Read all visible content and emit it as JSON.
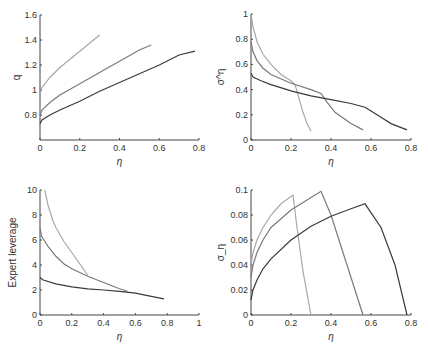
{
  "colors": {
    "light": "#a8a8a8",
    "medium": "#7a7a7a",
    "dark": "#3a3a3a",
    "axis": "#444444"
  },
  "chart_data": [
    {
      "type": "line",
      "id": "q",
      "xlabel": "η",
      "ylabel": "q",
      "xlim": [
        0,
        0.8
      ],
      "ylim": [
        0.6,
        1.6
      ],
      "xticks": [
        0,
        0.2,
        0.4,
        0.6,
        0.8
      ],
      "xtick_labels": [
        "0",
        "0.2",
        "0.4",
        "0.6",
        "0.8"
      ],
      "yticks": [
        0.8,
        1,
        1.2,
        1.4,
        1.6
      ],
      "ytick_labels": [
        "0.8",
        "1",
        "1.2",
        "1.4",
        "1.6"
      ],
      "series": [
        {
          "name": "light",
          "x": [
            0,
            0.01,
            0.05,
            0.1,
            0.2,
            0.3
          ],
          "y": [
            0.97,
            1.02,
            1.1,
            1.18,
            1.31,
            1.44
          ]
        },
        {
          "name": "medium",
          "x": [
            0,
            0.01,
            0.05,
            0.1,
            0.2,
            0.3,
            0.4,
            0.5,
            0.56
          ],
          "y": [
            0.8,
            0.84,
            0.9,
            0.96,
            1.05,
            1.14,
            1.23,
            1.32,
            1.36
          ]
        },
        {
          "name": "dark",
          "x": [
            0,
            0.01,
            0.05,
            0.1,
            0.2,
            0.3,
            0.4,
            0.5,
            0.6,
            0.7,
            0.78
          ],
          "y": [
            0.73,
            0.76,
            0.8,
            0.84,
            0.91,
            0.99,
            1.06,
            1.13,
            1.2,
            1.28,
            1.31
          ]
        }
      ]
    },
    {
      "type": "line",
      "id": "sigma-eta",
      "xlabel": "η",
      "ylabel": "σ^η",
      "xlim": [
        0,
        0.8
      ],
      "ylim": [
        0,
        1
      ],
      "xticks": [
        0,
        0.2,
        0.4,
        0.6,
        0.8
      ],
      "xtick_labels": [
        "0",
        "0.2",
        "0.4",
        "0.6",
        "0.8"
      ],
      "yticks": [
        0,
        0.2,
        0.4,
        0.6,
        0.8,
        1
      ],
      "ytick_labels": [
        "0",
        "0.2",
        "0.4",
        "0.6",
        "0.8",
        "1"
      ],
      "series": [
        {
          "name": "light",
          "x": [
            0,
            0.01,
            0.03,
            0.06,
            0.1,
            0.15,
            0.2,
            0.22,
            0.24,
            0.26,
            0.28,
            0.3
          ],
          "y": [
            1.0,
            0.9,
            0.78,
            0.68,
            0.6,
            0.52,
            0.47,
            0.44,
            0.33,
            0.22,
            0.13,
            0.07
          ]
        },
        {
          "name": "medium",
          "x": [
            0,
            0.01,
            0.03,
            0.06,
            0.1,
            0.2,
            0.3,
            0.35,
            0.38,
            0.42,
            0.5,
            0.56
          ],
          "y": [
            0.78,
            0.7,
            0.63,
            0.57,
            0.52,
            0.45,
            0.4,
            0.37,
            0.3,
            0.22,
            0.13,
            0.08
          ]
        },
        {
          "name": "dark",
          "x": [
            0,
            0.01,
            0.05,
            0.1,
            0.2,
            0.3,
            0.4,
            0.5,
            0.57,
            0.6,
            0.65,
            0.7,
            0.78
          ],
          "y": [
            0.53,
            0.5,
            0.47,
            0.44,
            0.39,
            0.35,
            0.32,
            0.29,
            0.26,
            0.23,
            0.18,
            0.13,
            0.08
          ]
        }
      ]
    },
    {
      "type": "line",
      "id": "expert-leverage",
      "xlabel": "η",
      "ylabel": "Expert leverage",
      "xlim": [
        0,
        1
      ],
      "ylim": [
        0,
        10
      ],
      "xticks": [
        0,
        0.2,
        0.4,
        0.6,
        0.8,
        1
      ],
      "xtick_labels": [
        "0",
        "0.2",
        "0.4",
        "0.6",
        "0.8",
        "1"
      ],
      "yticks": [
        0,
        2,
        4,
        6,
        8,
        10
      ],
      "ytick_labels": [
        "0",
        "2",
        "4",
        "6",
        "8",
        "10"
      ],
      "series": [
        {
          "name": "light",
          "x": [
            0.03,
            0.05,
            0.08,
            0.1,
            0.15,
            0.2,
            0.25,
            0.3
          ],
          "y": [
            10,
            8.8,
            7.6,
            7.0,
            5.9,
            5.0,
            4.1,
            3.2
          ]
        },
        {
          "name": "medium",
          "x": [
            0,
            0.01,
            0.03,
            0.05,
            0.1,
            0.15,
            0.2,
            0.3,
            0.4,
            0.5,
            0.55
          ],
          "y": [
            7.0,
            6.3,
            5.9,
            5.5,
            4.7,
            4.1,
            3.7,
            3.1,
            2.6,
            2.1,
            1.9
          ]
        },
        {
          "name": "dark",
          "x": [
            0,
            0.02,
            0.1,
            0.2,
            0.3,
            0.4,
            0.5,
            0.6,
            0.7,
            0.78
          ],
          "y": [
            3.0,
            2.8,
            2.5,
            2.25,
            2.1,
            2.0,
            1.9,
            1.75,
            1.5,
            1.3
          ]
        }
      ]
    },
    {
      "type": "line",
      "id": "sigma",
      "xlabel": "η",
      "ylabel": "σ_η",
      "xlim": [
        0,
        0.8
      ],
      "ylim": [
        0,
        0.1
      ],
      "xticks": [
        0,
        0.2,
        0.4,
        0.6,
        0.8
      ],
      "xtick_labels": [
        "0",
        "0.2",
        "0.4",
        "0.6",
        "0.8"
      ],
      "yticks": [
        0,
        0.02,
        0.04,
        0.06,
        0.08,
        0.1
      ],
      "ytick_labels": [
        "0",
        "0.02",
        "0.04",
        "0.06",
        "0.08",
        "0.1"
      ],
      "series": [
        {
          "name": "light",
          "x": [
            0,
            0.01,
            0.03,
            0.06,
            0.1,
            0.15,
            0.21,
            0.23,
            0.26,
            0.3
          ],
          "y": [
            0.04,
            0.05,
            0.06,
            0.07,
            0.08,
            0.089,
            0.096,
            0.07,
            0.035,
            0
          ]
        },
        {
          "name": "medium",
          "x": [
            0,
            0.01,
            0.03,
            0.06,
            0.1,
            0.2,
            0.3,
            0.35,
            0.4,
            0.47,
            0.56
          ],
          "y": [
            0.03,
            0.04,
            0.05,
            0.06,
            0.07,
            0.084,
            0.094,
            0.099,
            0.08,
            0.045,
            0
          ]
        },
        {
          "name": "dark",
          "x": [
            0,
            0.01,
            0.03,
            0.06,
            0.1,
            0.2,
            0.3,
            0.4,
            0.5,
            0.57,
            0.65,
            0.72,
            0.78
          ],
          "y": [
            0.012,
            0.02,
            0.028,
            0.037,
            0.045,
            0.06,
            0.071,
            0.079,
            0.085,
            0.089,
            0.07,
            0.04,
            0
          ]
        }
      ]
    }
  ],
  "panels": [
    {
      "x0": 40,
      "x1": 199,
      "y_top": 15,
      "y_bottom": 140
    },
    {
      "x0": 251,
      "x1": 411,
      "y_top": 14,
      "y_bottom": 140
    },
    {
      "x0": 40,
      "x1": 199,
      "y_top": 190,
      "y_bottom": 315
    },
    {
      "x0": 251,
      "x1": 411,
      "y_top": 190,
      "y_bottom": 315
    }
  ]
}
